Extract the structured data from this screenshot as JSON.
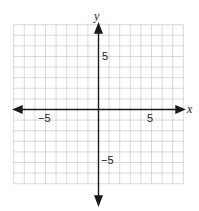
{
  "chart_data": {
    "type": "coordinate-plane",
    "title": "",
    "xlabel": "x",
    "ylabel": "y",
    "xlim": [
      -8,
      8
    ],
    "ylim": [
      -7,
      8
    ],
    "grid": true,
    "grid_step": 1,
    "tick_labels": {
      "x": [
        {
          "value": -5,
          "label": "−5"
        },
        {
          "value": 5,
          "label": "5"
        }
      ],
      "y": [
        {
          "value": 5,
          "label": "5"
        },
        {
          "value": -5,
          "label": "−5"
        }
      ]
    },
    "series": []
  },
  "labels": {
    "x_axis": "x",
    "y_axis": "y",
    "x_neg5": "−5",
    "x_pos5": "5",
    "y_pos5": "5",
    "y_neg5": "−5"
  },
  "colors": {
    "grid": "#c8c8c8",
    "axis": "#1a1a1a",
    "background": "#ffffff"
  }
}
